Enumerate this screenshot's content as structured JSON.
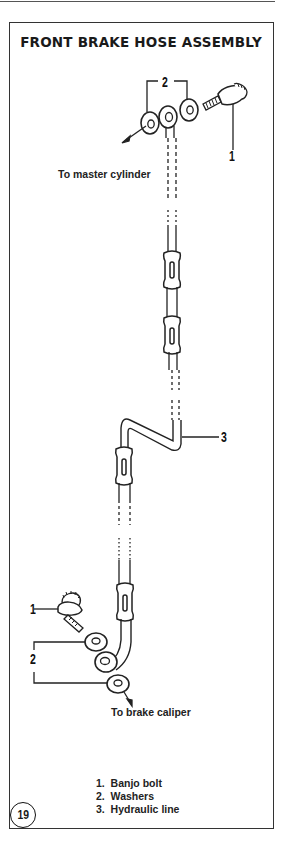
{
  "figure": {
    "title": "FRONT BRAKE HOSE ASSEMBLY",
    "figure_number": "19"
  },
  "callouts": {
    "top_washers": "2",
    "top_banjo_bolt": "1",
    "hydraulic_line": "3",
    "bottom_banjo_bolt": "1",
    "bottom_washers": "2"
  },
  "annotations": {
    "to_master_cylinder": "To master cylinder",
    "to_brake_caliper": "To brake caliper"
  },
  "legend": {
    "items": [
      {
        "number": "1.",
        "label": "Banjo bolt"
      },
      {
        "number": "2.",
        "label": "Washers"
      },
      {
        "number": "3.",
        "label": "Hydraulic line"
      }
    ]
  }
}
